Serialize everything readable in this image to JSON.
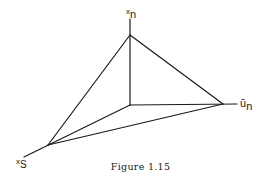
{
  "figure": {
    "caption": "Figure 1.15",
    "labels": {
      "top": {
        "var": "x",
        "sub": "n"
      },
      "right": {
        "var": "ū",
        "sub": "n"
      },
      "left": {
        "var": "x",
        "sub": "s"
      }
    },
    "line_color": "#1a1a1a",
    "background": "#ffffff"
  }
}
